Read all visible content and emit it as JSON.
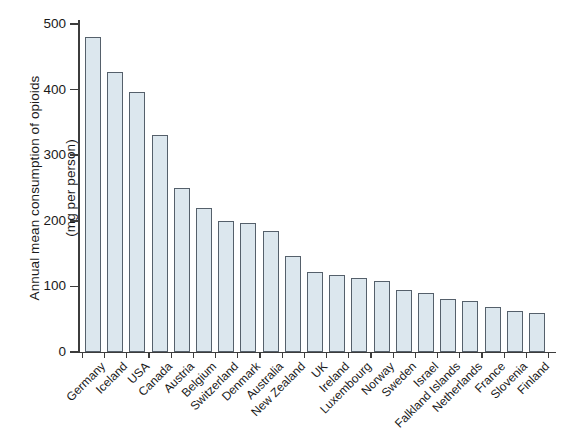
{
  "chart_data": {
    "type": "bar",
    "title": "",
    "subtitle": "",
    "xlabel": "",
    "ylabel": "Annual mean consumption of opioids (mg per person)",
    "ylabel_lines": [
      "Annual mean consumption of opioids",
      "(mg per person)"
    ],
    "ylim": [
      0,
      500
    ],
    "ytick_values": [
      0,
      100,
      200,
      300,
      400,
      500
    ],
    "ytick_labels": [
      "0",
      "100",
      "200",
      "300",
      "400",
      "500"
    ],
    "grid": false,
    "legend": null,
    "bar_fill_color": "#dce7ee",
    "bar_edge_color": "#55606b",
    "axis_color": "#3c3c3c",
    "background_color": "#ffffff",
    "categories": [
      "Germany",
      "Iceland",
      "USA",
      "Canada",
      "Austria",
      "Belgium",
      "Switzerland",
      "Denmark",
      "Australia",
      "New Zealand",
      "UK",
      "Ireland",
      "Luxembourg",
      "Norway",
      "Sweden",
      "Israel",
      "Falkland Islands",
      "Netherlands",
      "France",
      "Slovenia",
      "Finland"
    ],
    "values": [
      480,
      427,
      397,
      331,
      250,
      220,
      200,
      196,
      185,
      146,
      122,
      117,
      113,
      108,
      95,
      90,
      81,
      78,
      68,
      63,
      59
    ]
  }
}
